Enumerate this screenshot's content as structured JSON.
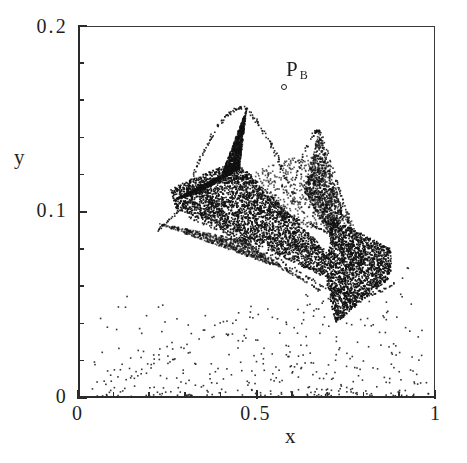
{
  "figure": {
    "kind": "scatter-attractor-plot",
    "background": "#ffffff",
    "ink_color": "#1f1f1f"
  },
  "axes": {
    "x": {
      "label": "x",
      "tick_labels": [
        "0",
        "0.5",
        "1"
      ],
      "tick_values": [
        0,
        0.5,
        1
      ],
      "minor_tick_step": 0.1,
      "range": [
        0,
        1
      ]
    },
    "y": {
      "label": "y",
      "tick_labels": [
        "0",
        "0.1",
        "0.2"
      ],
      "tick_values": [
        0,
        0.1,
        0.2
      ],
      "minor_tick_step": 0.02,
      "range": [
        0,
        0.2
      ]
    }
  },
  "annotations": [
    {
      "name": "point-pb",
      "text": "P",
      "subscript": "B",
      "marker": "open-circle",
      "marker_x": 0.572,
      "marker_y": 0.1665
    }
  ],
  "chart_data": {
    "type": "scatter",
    "title": "",
    "xlabel": "x",
    "ylabel": "y",
    "xlim": [
      0,
      1
    ],
    "ylim": [
      0,
      0.2
    ],
    "xticks": [
      0,
      0.5,
      1
    ],
    "yticks": [
      0,
      0.1,
      0.2
    ],
    "xtick_labels": [
      "0",
      "0.5",
      "1"
    ],
    "ytick_labels": [
      "0",
      "0.1",
      "0.2"
    ],
    "grid": false,
    "legend": false,
    "marker": "pixel-dot",
    "marker_color": "#111111",
    "marker_size_px": 1.6,
    "approx_point_count": 9000,
    "regions": [
      {
        "name": "left-dense-wedge",
        "density": "high",
        "n": 3000,
        "polygon": [
          [
            0.256,
            0.113
          ],
          [
            0.44,
            0.128
          ],
          [
            0.7,
            0.0785
          ],
          [
            0.7,
            0.0645
          ],
          [
            0.43,
            0.0885
          ],
          [
            0.272,
            0.1025
          ]
        ]
      },
      {
        "name": "right-dense-triangle",
        "density": "high",
        "n": 2000,
        "polygon": [
          [
            0.705,
            0.0975
          ],
          [
            0.875,
            0.0805
          ],
          [
            0.875,
            0.0655
          ],
          [
            0.72,
            0.0405
          ],
          [
            0.695,
            0.0605
          ]
        ]
      },
      {
        "name": "left-upper-scatter-fan",
        "density": "medium",
        "n": 1400,
        "polygon": [
          [
            0.262,
            0.1065
          ],
          [
            0.4,
            0.1205
          ],
          [
            0.47,
            0.1555
          ],
          [
            0.45,
            0.1235
          ],
          [
            0.335,
            0.1105
          ]
        ]
      },
      {
        "name": "right-upper-scatter-fan",
        "density": "medium",
        "n": 900,
        "polygon": [
          [
            0.63,
            0.1115
          ],
          [
            0.672,
            0.1435
          ],
          [
            0.745,
            0.0975
          ],
          [
            0.705,
            0.0875
          ]
        ]
      },
      {
        "name": "lower-left-thin-tail",
        "density": "low",
        "n": 700,
        "polygon": [
          [
            0.218,
            0.0945
          ],
          [
            0.46,
            0.0855
          ],
          [
            0.7,
            0.0555
          ],
          [
            0.56,
            0.0705
          ],
          [
            0.3,
            0.0885
          ]
        ]
      },
      {
        "name": "interior-sparse-strands",
        "density": "low",
        "n": 600,
        "polygon": [
          [
            0.41,
            0.1165
          ],
          [
            0.655,
            0.1335
          ],
          [
            0.8,
            0.0855
          ],
          [
            0.64,
            0.0925
          ]
        ]
      },
      {
        "name": "background-stray-points",
        "density": "very-low",
        "n": 220,
        "polygon": [
          [
            0.03,
            0.0
          ],
          [
            0.985,
            0.0
          ],
          [
            0.93,
            0.072
          ],
          [
            0.5,
            0.052
          ],
          [
            0.12,
            0.02
          ]
        ]
      }
    ]
  }
}
